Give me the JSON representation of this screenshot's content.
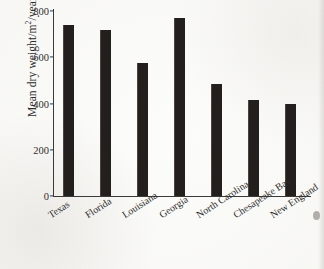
{
  "chart_data": {
    "type": "bar",
    "title": "",
    "xlabel": "",
    "ylabel": "Mean dry weight/m2/year",
    "ylabel_parts": {
      "before": "Mean dry weight/m",
      "superscript": "2",
      "after": "/year"
    },
    "categories": [
      "Texas",
      "Florida",
      "Louisiana",
      "Georgia",
      "North Carolina",
      "Chesapeake Bay",
      "New England"
    ],
    "values": [
      740,
      718,
      575,
      770,
      485,
      415,
      400
    ],
    "ytick_labels": [
      "0",
      "200",
      "400",
      "600",
      "800"
    ],
    "ytick_values": [
      0,
      200,
      400,
      600,
      800
    ],
    "ylim": [
      0,
      800
    ],
    "grid": false,
    "legend": false,
    "bar_color": "#231f1d",
    "axis_color": "#3a3a3a",
    "background_color": "#fcfcfa"
  },
  "figure": {
    "name": "mean-dry-weight-bar-chart"
  }
}
